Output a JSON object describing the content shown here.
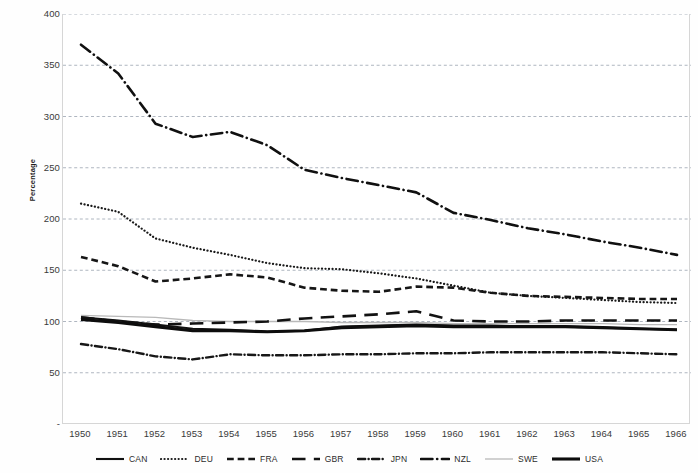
{
  "chart_data": {
    "type": "line",
    "title": "",
    "xlabel": "",
    "ylabel": "Percentage",
    "xlim": [
      1950,
      1966
    ],
    "ylim": [
      0,
      400
    ],
    "yticks": [
      0,
      50,
      100,
      150,
      200,
      250,
      300,
      350,
      400
    ],
    "ytick_labels": [
      "-",
      "50",
      "100",
      "150",
      "200",
      "250",
      "300",
      "350",
      "400"
    ],
    "grid": true,
    "grid_style": "dashed-horizontal",
    "legend_position": "bottom",
    "x": [
      1950,
      1951,
      1952,
      1953,
      1954,
      1955,
      1956,
      1957,
      1958,
      1959,
      1960,
      1961,
      1962,
      1963,
      1964,
      1965,
      1966
    ],
    "categories": [
      "1950",
      "1951",
      "1952",
      "1953",
      "1954",
      "1955",
      "1956",
      "1957",
      "1958",
      "1959",
      "1960",
      "1961",
      "1962",
      "1963",
      "1964",
      "1965",
      "1966"
    ],
    "series": [
      {
        "name": "CAN",
        "style": "solid",
        "width": 2.1,
        "color": "#111111",
        "values": [
          104,
          101,
          97,
          93,
          92,
          90,
          91,
          95,
          96,
          97,
          96,
          96,
          95,
          95,
          94,
          93,
          92
        ]
      },
      {
        "name": "DEU",
        "style": "dotted",
        "width": 2.2,
        "color": "#1a1a1a",
        "values": [
          215,
          207,
          181,
          172,
          165,
          157,
          152,
          151,
          147,
          142,
          135,
          128,
          125,
          123,
          121,
          119,
          118
        ]
      },
      {
        "name": "FRA",
        "style": "dashed",
        "width": 2.6,
        "color": "#161616",
        "values": [
          163,
          154,
          139,
          142,
          146,
          143,
          133,
          130,
          129,
          134,
          133,
          128,
          125,
          124,
          123,
          122,
          122
        ]
      },
      {
        "name": "GBR",
        "style": "longdash",
        "width": 2.6,
        "color": "#121212",
        "values": [
          104,
          100,
          97,
          98,
          99,
          100,
          103,
          105,
          107,
          110,
          101,
          100,
          100,
          101,
          101,
          101,
          101
        ]
      },
      {
        "name": "JPN",
        "style": "dashdot",
        "width": 2.4,
        "color": "#171717",
        "values": [
          78,
          73,
          66,
          63,
          68,
          67,
          67,
          68,
          68,
          69,
          69,
          70,
          70,
          70,
          70,
          69,
          68
        ]
      },
      {
        "name": "NZL",
        "style": "dashdotlong",
        "width": 2.6,
        "color": "#101010",
        "values": [
          370,
          342,
          293,
          280,
          285,
          272,
          248,
          240,
          233,
          226,
          206,
          199,
          191,
          185,
          178,
          172,
          165
        ]
      },
      {
        "name": "SWE",
        "style": "thin-solid",
        "width": 1.3,
        "color": "#b9b9b9",
        "values": [
          106,
          105,
          104,
          101,
          100,
          100,
          100,
          99,
          99,
          99,
          98,
          98,
          98,
          98,
          98,
          97,
          97
        ]
      },
      {
        "name": "USA",
        "style": "thick-solid",
        "width": 3.1,
        "color": "#0d0d0d",
        "values": [
          102,
          99,
          95,
          91,
          91,
          90,
          91,
          94,
          95,
          96,
          95,
          95,
          95,
          95,
          94,
          93,
          92
        ]
      }
    ]
  },
  "axes": {
    "y_title": "Percentage"
  }
}
